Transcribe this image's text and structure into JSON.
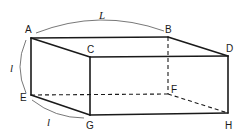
{
  "figure": {
    "type": "rectangular-box-perspective",
    "vertices": {
      "A": {
        "label": "A",
        "x": 31,
        "y": 38
      },
      "B": {
        "label": "B",
        "x": 168,
        "y": 37
      },
      "C": {
        "label": "C",
        "x": 90,
        "y": 57
      },
      "D": {
        "label": "D",
        "x": 228,
        "y": 56
      },
      "E": {
        "label": "E",
        "x": 31,
        "y": 95
      },
      "F": {
        "label": "F",
        "x": 168,
        "y": 94
      },
      "G": {
        "label": "G",
        "x": 90,
        "y": 115
      },
      "H": {
        "label": "H",
        "x": 228,
        "y": 113
      }
    },
    "visible_edges": [
      "AB",
      "AC",
      "BD",
      "CD",
      "AE",
      "CG",
      "DH",
      "EG",
      "GH"
    ],
    "hidden_edges": [
      "BF",
      "EF",
      "FH"
    ],
    "dimensions": [
      {
        "between": "A-B",
        "label": "L"
      },
      {
        "between": "A-E",
        "label": "l"
      },
      {
        "between": "E-G",
        "label": "l"
      }
    ],
    "colors": {
      "stroke": "#1a1a1a",
      "background": "#ffffff"
    }
  }
}
